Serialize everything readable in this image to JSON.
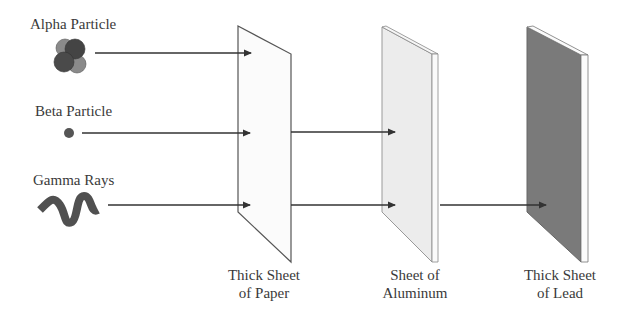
{
  "diagram": {
    "type": "radiation-penetration",
    "sources": [
      {
        "id": "alpha",
        "label": "Alpha Particle",
        "icon": "alpha-particle-icon"
      },
      {
        "id": "beta",
        "label": "Beta Particle",
        "icon": "beta-particle-icon"
      },
      {
        "id": "gamma",
        "label": "Gamma Rays",
        "icon": "gamma-wave-icon"
      }
    ],
    "barriers": [
      {
        "id": "paper",
        "label_line1": "Thick Sheet",
        "label_line2": "of Paper",
        "color": "#fbfbfb"
      },
      {
        "id": "aluminum",
        "label_line1": "Sheet of",
        "label_line2": "Aluminum",
        "color": "#ececec"
      },
      {
        "id": "lead",
        "label_line1": "Thick Sheet",
        "label_line2": "of Lead",
        "color": "#7a7a7a"
      }
    ],
    "paths": [
      {
        "source": "alpha",
        "stopped_by": "paper"
      },
      {
        "source": "beta",
        "stopped_by": "aluminum"
      },
      {
        "source": "gamma",
        "stopped_by": "lead"
      }
    ],
    "colors": {
      "line": "#333333",
      "particle_dark": "#4a4a4a",
      "particle_light": "#8a8a8a"
    }
  }
}
